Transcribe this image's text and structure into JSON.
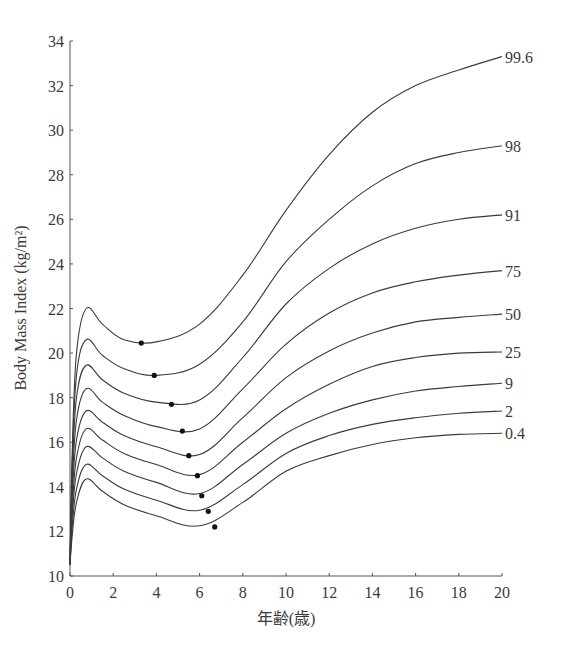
{
  "chart_data": {
    "type": "line",
    "title": "",
    "xlabel": "年齢(歳)",
    "ylabel": "Body Mass Index (kg/m²)",
    "xlim": [
      0,
      20
    ],
    "ylim": [
      10,
      34
    ],
    "xticks": [
      0,
      2,
      4,
      6,
      8,
      10,
      12,
      14,
      16,
      18,
      20
    ],
    "yticks": [
      10,
      12,
      14,
      16,
      18,
      20,
      22,
      24,
      26,
      28,
      30,
      32,
      34
    ],
    "grid": false,
    "legend": "inline labels at right end of each curve",
    "x": [
      0,
      0.1,
      0.3,
      0.75,
      1.5,
      2.5,
      4,
      6,
      8,
      10,
      12,
      14,
      16,
      18,
      20
    ],
    "series": [
      {
        "name": "99.6",
        "values": [
          10.5,
          15.5,
          20.0,
          22.0,
          21.3,
          20.6,
          20.5,
          21.3,
          23.5,
          26.4,
          28.9,
          30.8,
          32.0,
          32.7,
          33.3
        ],
        "rebound_point": {
          "age": 3.3,
          "bmi": 20.45
        }
      },
      {
        "name": "98",
        "values": [
          10.5,
          15.0,
          19.0,
          20.6,
          19.9,
          19.3,
          19.0,
          19.5,
          21.4,
          24.1,
          26.0,
          27.5,
          28.5,
          29.0,
          29.3
        ],
        "rebound_point": {
          "age": 3.9,
          "bmi": 19.0
        }
      },
      {
        "name": "91",
        "values": [
          10.5,
          14.5,
          18.0,
          19.45,
          18.8,
          18.2,
          17.8,
          17.9,
          19.8,
          22.2,
          23.8,
          24.9,
          25.6,
          26.0,
          26.2
        ],
        "rebound_point": {
          "age": 4.7,
          "bmi": 17.7
        }
      },
      {
        "name": "75",
        "values": [
          10.5,
          14.0,
          17.0,
          18.4,
          17.8,
          17.2,
          16.7,
          16.6,
          18.4,
          20.4,
          21.8,
          22.7,
          23.2,
          23.5,
          23.7
        ],
        "rebound_point": {
          "age": 5.2,
          "bmi": 16.5
        }
      },
      {
        "name": "50",
        "values": [
          10.5,
          13.5,
          16.1,
          17.4,
          16.9,
          16.3,
          15.8,
          15.45,
          17.1,
          18.9,
          20.1,
          20.9,
          21.4,
          21.6,
          21.75
        ],
        "rebound_point": {
          "age": 5.5,
          "bmi": 15.4
        }
      },
      {
        "name": "25",
        "values": [
          10.5,
          13.0,
          15.3,
          16.6,
          16.1,
          15.5,
          15.0,
          14.55,
          16.0,
          17.5,
          18.6,
          19.4,
          19.8,
          20.0,
          20.05
        ],
        "rebound_point": {
          "age": 5.9,
          "bmi": 14.5
        }
      },
      {
        "name": "9",
        "values": [
          10.5,
          12.6,
          14.6,
          15.8,
          15.3,
          14.7,
          14.2,
          13.7,
          15.0,
          16.4,
          17.3,
          17.9,
          18.3,
          18.5,
          18.65
        ],
        "rebound_point": {
          "age": 6.1,
          "bmi": 13.6
        }
      },
      {
        "name": "2",
        "values": [
          10.5,
          12.2,
          13.9,
          15.0,
          14.5,
          13.9,
          13.4,
          12.95,
          14.1,
          15.5,
          16.3,
          16.8,
          17.1,
          17.3,
          17.4
        ],
        "rebound_point": {
          "age": 6.4,
          "bmi": 12.9
        }
      },
      {
        "name": "0.4",
        "values": [
          10.5,
          11.8,
          13.3,
          14.35,
          13.8,
          13.2,
          12.7,
          12.25,
          13.3,
          14.7,
          15.4,
          15.9,
          16.2,
          16.35,
          16.4
        ],
        "rebound_point": {
          "age": 6.7,
          "bmi": 12.2
        }
      }
    ]
  },
  "colors": {
    "line": "#3a3a3a",
    "axis": "#555555",
    "dot": "#111111",
    "background": "#ffffff"
  }
}
